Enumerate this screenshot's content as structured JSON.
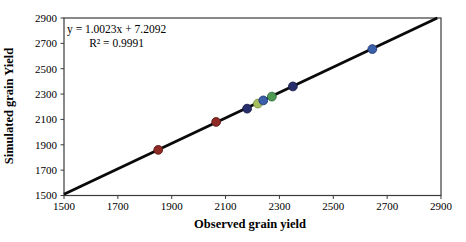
{
  "chart_data": {
    "type": "scatter",
    "xlabel": "Observed grain yield",
    "ylabel": "Simulated grain Yield",
    "xlim": [
      1500,
      2900
    ],
    "ylim": [
      1500,
      2900
    ],
    "xticks": [
      1500,
      1700,
      1900,
      2100,
      2300,
      2500,
      2700,
      2900
    ],
    "yticks": [
      1500,
      1700,
      1900,
      2100,
      2300,
      2500,
      2700,
      2900
    ],
    "grid": false,
    "legend": "none",
    "frame": true,
    "annotation": {
      "line1": "y = 1.0023x + 7.2092",
      "line2": "R² = 0.9991"
    },
    "trendline": {
      "slope": 1.0023,
      "intercept": 7.2092,
      "r_squared": 0.9991,
      "color": "#0a0a0a",
      "width": 2.8
    },
    "series": [
      {
        "name": "dark-red-points",
        "color": "#8f2a24",
        "edge": "#5a1a14",
        "points": [
          [
            1850,
            1860
          ],
          [
            2065,
            2080
          ]
        ]
      },
      {
        "name": "navy-points",
        "color": "#272e6b",
        "edge": "#161b45",
        "points": [
          [
            2180,
            2185
          ],
          [
            2350,
            2360
          ]
        ]
      },
      {
        "name": "yellow-green-points",
        "color": "#a6bd60",
        "edge": "#7a8f3e",
        "points": [
          [
            2220,
            2225
          ]
        ]
      },
      {
        "name": "green-points",
        "color": "#4f9b55",
        "edge": "#2f6b38",
        "points": [
          [
            2272,
            2280
          ]
        ]
      },
      {
        "name": "blue-points",
        "color": "#3b5fa8",
        "edge": "#243c73",
        "points": [
          [
            2240,
            2250
          ],
          [
            2645,
            2655
          ]
        ]
      }
    ]
  },
  "colors": {
    "axis": "#3b3b3b",
    "text": "#000000",
    "background": "#ffffff"
  }
}
